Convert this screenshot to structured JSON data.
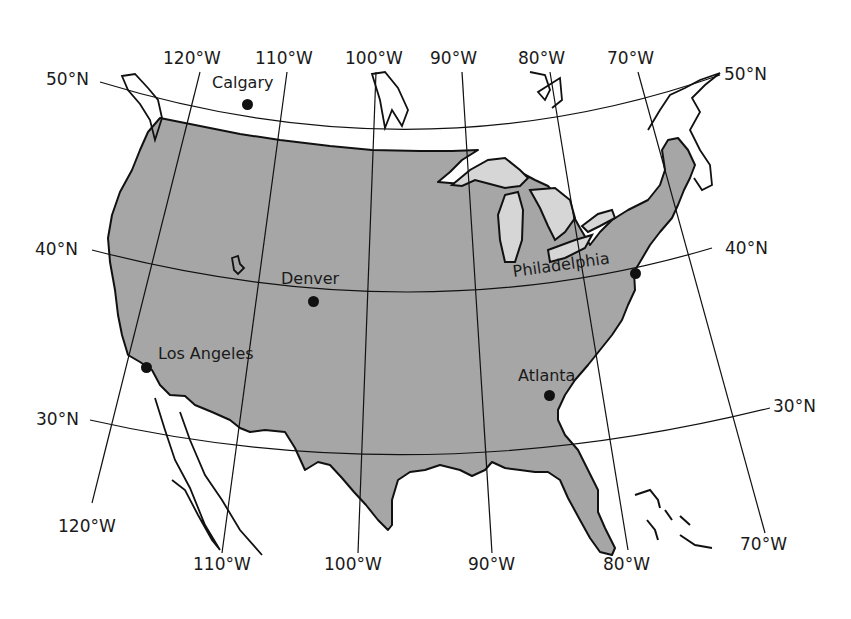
{
  "map": {
    "title": "",
    "land_color": "#a6a6a6",
    "lake_color": "#d6d6d6",
    "line_color": "#111111",
    "parallels": [
      {
        "label_left": "50°N",
        "label_right": "50°N"
      },
      {
        "label_left": "40°N",
        "label_right": "40°N"
      },
      {
        "label_left": "30°N",
        "label_right": "30°N"
      }
    ],
    "meridians_top": [
      "120°W",
      "110°W",
      "100°W",
      "90°W",
      "80°W",
      "70°W"
    ],
    "meridians_bottom": [
      "120°W",
      "110°W",
      "100°W",
      "90°W",
      "80°W",
      "70°W"
    ],
    "cities": [
      {
        "name": "Calgary"
      },
      {
        "name": "Denver"
      },
      {
        "name": "Philadelphia"
      },
      {
        "name": "Los Angeles"
      },
      {
        "name": "Atlanta"
      }
    ]
  }
}
